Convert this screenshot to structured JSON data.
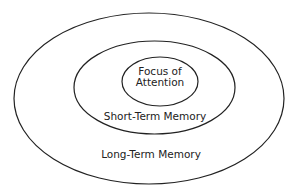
{
  "diagram": {
    "colors": {
      "stroke": "#222222",
      "text": "#222222",
      "background": "#ffffff"
    },
    "regions": [
      {
        "id": "long-term-memory",
        "label": "Long-Term Memory",
        "ellipse": {
          "cx": 149,
          "cy": 98.5,
          "rx": 135,
          "ry": 85.5
        },
        "label_pos": {
          "x": 151,
          "y": 158
        }
      },
      {
        "id": "short-term-memory",
        "label": "Short-Term Memory",
        "ellipse": {
          "cx": 154.5,
          "cy": 87.5,
          "rx": 80.5,
          "ry": 46.5
        },
        "label_pos": {
          "x": 155,
          "y": 120
        }
      },
      {
        "id": "focus-of-attention",
        "label_lines": [
          "Focus of",
          "Attention"
        ],
        "ellipse": {
          "cx": 160,
          "cy": 81.5,
          "rx": 38,
          "ry": 24.5
        },
        "label_pos": {
          "x": 160,
          "y": 75
        }
      }
    ]
  }
}
